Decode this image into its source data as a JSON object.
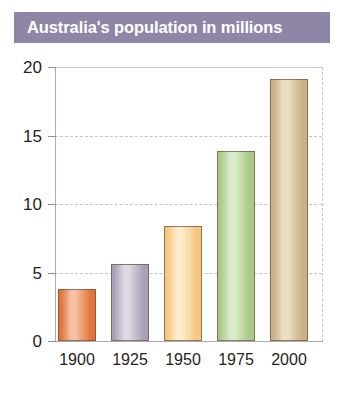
{
  "title": {
    "text": "Australia's population in millions",
    "banner_color": "#8f85a6",
    "text_color": "#ffffff"
  },
  "chart_data": {
    "type": "bar",
    "title": "Australia's population in millions",
    "xlabel": "",
    "ylabel": "",
    "categories": [
      "1900",
      "1925",
      "1950",
      "1975",
      "2000"
    ],
    "values": [
      3.8,
      5.6,
      8.4,
      13.9,
      19.1
    ],
    "unit": "millions",
    "ylim": [
      0,
      20
    ],
    "yticks": [
      0,
      5,
      10,
      15,
      20
    ],
    "ytick_labels": [
      "0",
      "5",
      "10",
      "15",
      "20"
    ],
    "grid": true,
    "legend": false,
    "bar_colors": [
      "#e2743c",
      "#a99fb8",
      "#f6c680",
      "#a9c985",
      "#cbb184"
    ],
    "bar_highlight_colors": [
      "#f5c3a4",
      "#ded9e6",
      "#fdeccb",
      "#dcebcc",
      "#eadfc5"
    ]
  },
  "axes": {
    "y_ticks": [
      {
        "label": "20",
        "value": 20
      },
      {
        "label": "15",
        "value": 15
      },
      {
        "label": "10",
        "value": 10
      },
      {
        "label": "5",
        "value": 5
      },
      {
        "label": "0",
        "value": 0
      }
    ],
    "x_ticks": [
      {
        "label": "1900"
      },
      {
        "label": "1925"
      },
      {
        "label": "1950"
      },
      {
        "label": "1975"
      },
      {
        "label": "2000"
      }
    ]
  },
  "bars": [
    {
      "category": "1900",
      "value": 3.8
    },
    {
      "category": "1925",
      "value": 5.6
    },
    {
      "category": "1950",
      "value": 8.4
    },
    {
      "category": "1975",
      "value": 13.9
    },
    {
      "category": "2000",
      "value": 19.1
    }
  ]
}
